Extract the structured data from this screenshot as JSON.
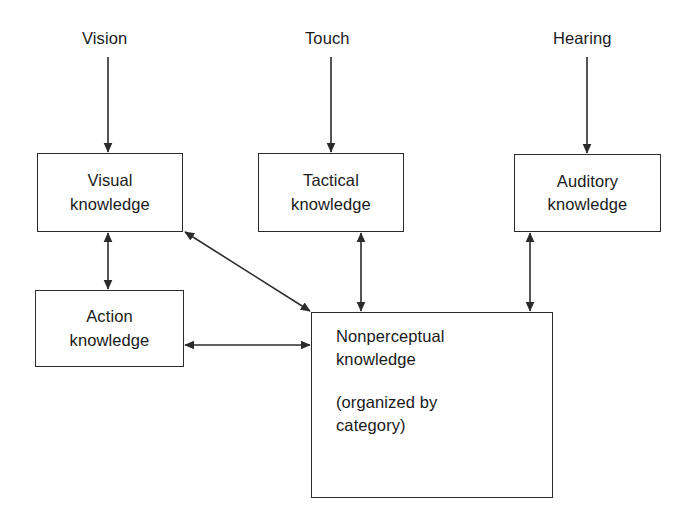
{
  "diagram": {
    "background_color": "#ffffff",
    "stroke_color": "#2b2b2b",
    "text_color": "#1a1a1a",
    "source_labels": [
      {
        "id": "vision",
        "text": "Vision"
      },
      {
        "id": "touch",
        "text": "Touch"
      },
      {
        "id": "hearing",
        "text": "Hearing"
      }
    ],
    "nodes": [
      {
        "id": "visual-knowledge",
        "lines": [
          "Visual",
          "knowledge"
        ],
        "line1": "Visual",
        "line2": "knowledge"
      },
      {
        "id": "tactical-knowledge",
        "lines": [
          "Tactical",
          "knowledge"
        ],
        "line1": "Tactical",
        "line2": "knowledge"
      },
      {
        "id": "auditory-knowledge",
        "lines": [
          "Auditory",
          "knowledge"
        ],
        "line1": "Auditory",
        "line2": "knowledge"
      },
      {
        "id": "action-knowledge",
        "lines": [
          "Action",
          "knowledge"
        ],
        "line1": "Action",
        "line2": "knowledge"
      },
      {
        "id": "nonperceptual-knowledge",
        "lines": [
          "Nonperceptual",
          "knowledge",
          "(organized by",
          "category)"
        ],
        "line1": "Nonperceptual",
        "line2": "knowledge",
        "line3": "(organized by",
        "line4": "category)"
      }
    ],
    "edges": [
      {
        "id": "vision-to-visual",
        "from": "vision",
        "to": "visual-knowledge",
        "heads": "single"
      },
      {
        "id": "touch-to-tactical",
        "from": "touch",
        "to": "tactical-knowledge",
        "heads": "single"
      },
      {
        "id": "hearing-to-auditory",
        "from": "hearing",
        "to": "auditory-knowledge",
        "heads": "single"
      },
      {
        "id": "visual-action",
        "from": "visual-knowledge",
        "to": "action-knowledge",
        "heads": "double"
      },
      {
        "id": "visual-nonperceptual",
        "from": "visual-knowledge",
        "to": "nonperceptual-knowledge",
        "heads": "double"
      },
      {
        "id": "tactical-nonperceptual",
        "from": "tactical-knowledge",
        "to": "nonperceptual-knowledge",
        "heads": "double"
      },
      {
        "id": "auditory-nonperceptual",
        "from": "auditory-knowledge",
        "to": "nonperceptual-knowledge",
        "heads": "double"
      },
      {
        "id": "action-nonperceptual",
        "from": "action-knowledge",
        "to": "nonperceptual-knowledge",
        "heads": "double"
      }
    ]
  }
}
